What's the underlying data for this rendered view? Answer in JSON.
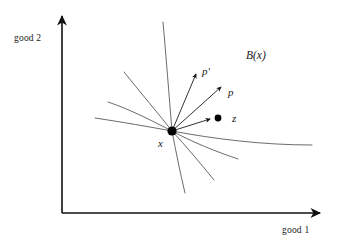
{
  "figure": {
    "background_color": "#ffffff",
    "axis_color": "#111111",
    "curve_color": "#5a5a5a",
    "marker_color": "#000000"
  },
  "axes": {
    "y_axis": {
      "label": "good 2",
      "icon": "arrow-up-icon",
      "origin": [
        62,
        213
      ],
      "tip": [
        62,
        12
      ]
    },
    "x_axis": {
      "label": "good 1",
      "icon": "arrow-right-icon",
      "origin": [
        62,
        213
      ],
      "tip": [
        325,
        213
      ]
    }
  },
  "points": {
    "x": {
      "label": "x",
      "position": [
        172,
        131
      ],
      "marker": "filled-dot",
      "radius": 4.6
    },
    "z": {
      "label": "z",
      "position": [
        218,
        118
      ],
      "marker": "filled-dot",
      "radius": 3.4
    }
  },
  "vectors": [
    {
      "name": "p-prime-vector",
      "label": "p'",
      "from": [
        172,
        131
      ],
      "to": [
        196,
        72
      ],
      "arrowhead": "open-arrow"
    },
    {
      "name": "p-vector",
      "label": "p",
      "from": [
        172,
        131
      ],
      "to": [
        222,
        86
      ],
      "arrowhead": "open-arrow"
    },
    {
      "name": "z-vector",
      "label": "z",
      "from": [
        172,
        131
      ],
      "to": [
        212,
        119
      ],
      "arrowhead": "open-arrow"
    }
  ],
  "region": {
    "label": "B(x)",
    "position": [
      246,
      50
    ]
  },
  "curves": [
    {
      "name": "curve-up-vertical",
      "path": "M 172 131 C 169 95 166 55 163 22"
    },
    {
      "name": "curve-upper-left-steep",
      "path": "M 172 131 C 158 113 140 92 124 72"
    },
    {
      "name": "curve-upper-left-shallow",
      "path": "M 172 131 C 154 122 132 110 108 102"
    },
    {
      "name": "curve-left-flat",
      "path": "M 172 131 C 150 127 122 122 95 118"
    },
    {
      "name": "curve-right-long",
      "path": "M 172 131 C 215 139 262 145 312 145"
    },
    {
      "name": "curve-lower-right-mid",
      "path": "M 172 131 C 192 142 217 152 238 159"
    },
    {
      "name": "curve-lower-right-steep",
      "path": "M 172 131 C 186 146 201 164 214 180"
    },
    {
      "name": "curve-down-steep",
      "path": "M 172 131 C 176 152 180 172 185 193"
    }
  ]
}
